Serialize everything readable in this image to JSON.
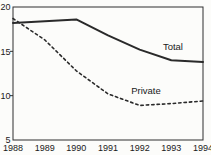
{
  "figure": {
    "background": "#fcfcfa",
    "line_color": "#2a2a2a",
    "text_color": "#1a1a1a",
    "axis_color": "#2f2f2f"
  },
  "chart_data": {
    "type": "line",
    "title": "",
    "xlabel": "",
    "ylabel": "",
    "x": [
      1988,
      1989,
      1990,
      1991,
      1992,
      1993,
      1994
    ],
    "x_tick_labels": [
      "1988",
      "1989",
      "1990",
      "1991",
      "1992",
      "1993",
      "1994"
    ],
    "y_ticks": [
      5,
      10,
      15,
      20
    ],
    "y_tick_labels": [
      "5",
      "10",
      "15",
      "20"
    ],
    "xlim": [
      1988,
      1994
    ],
    "ylim": [
      5,
      20
    ],
    "grid": false,
    "legend_position": "inline-labels",
    "series": [
      {
        "name": "Total",
        "style": "solid",
        "values": [
          18.2,
          18.4,
          18.6,
          16.8,
          15.2,
          14.0,
          13.8
        ]
      },
      {
        "name": "Private",
        "style": "dashed",
        "values": [
          18.7,
          16.3,
          12.8,
          10.2,
          8.9,
          9.1,
          9.4
        ]
      }
    ],
    "annotations": [
      {
        "text": "Total",
        "x": 1993.05,
        "y": 15.5
      },
      {
        "text": "Private",
        "x": 1992.2,
        "y": 10.5
      }
    ]
  }
}
